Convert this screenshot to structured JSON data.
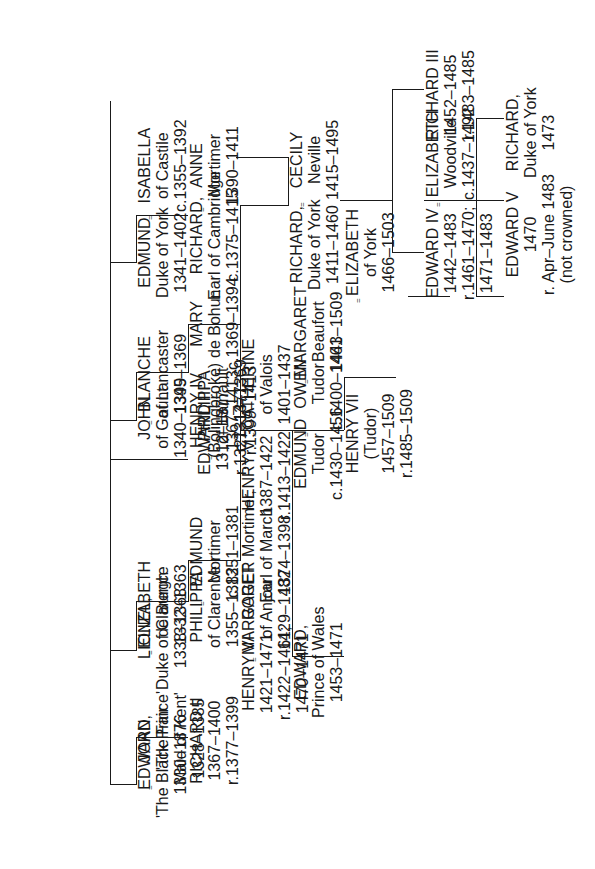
{
  "document": {
    "title": "Plantagenet, Lancaster, York and Tudor Royal Family Tree",
    "orientation": "rotated-90-ccw",
    "ink_color": "#1a1a1a",
    "background_color": "#ffffff"
  },
  "symbols": {
    "marriage": "=",
    "marriage_label": "equals-marriage-symbol"
  },
  "people": {
    "edward_iii": {
      "name": "EDWARD III",
      "life": "1312–1377",
      "reign": "r.1327–1377"
    },
    "philippa_hainault": {
      "name": "PHILIPPA",
      "detail": "of Hainault",
      "life": "c.1314–1369"
    },
    "edward_black_prince": {
      "name": "EDWARD",
      "detail": "'The Black Prince'",
      "life": "1330–1376"
    },
    "joan_kent": {
      "name": "JOAN,",
      "detail": "'The Fair",
      "detail2": "Maid of Kent'",
      "life": "1328–1385"
    },
    "richard_ii": {
      "name": "RICHARD II",
      "life": "1367–1400",
      "reign": "r.1377–1399"
    },
    "lionel_clarence": {
      "name": "LIONEL,",
      "detail": "Duke of Clarence",
      "life": "1338–1368"
    },
    "elizabeth_de_burgh": {
      "name": "ELIZABETH",
      "detail": "de Burgh",
      "life": "1332–1363"
    },
    "philippa_clarence": {
      "name": "PHILIPPA",
      "detail": "of Clarence",
      "life": "1355–1382"
    },
    "edmund_mortimer": {
      "name": "EDMUND",
      "detail": "Mortimer",
      "life": "c.1351–1381"
    },
    "roger_mortimer": {
      "name": "ROGER Mortimer,",
      "detail": "Earl of March",
      "life": "1374–1398"
    },
    "john_gaunt": {
      "name": "JOHN",
      "detail": "of Gaunt",
      "life": "1340–1399"
    },
    "blanche_lancaster": {
      "name": "BLANCHE",
      "detail": "of Lancaster",
      "life": "1345–1369"
    },
    "henry_iv": {
      "name": "HENRY IV",
      "detail": "(Bolingbroke)",
      "life": "1367–1413",
      "reign": "r.1399–1413"
    },
    "mary_de_bohun": {
      "name": "MARY",
      "detail": "de Bohun",
      "life": "c.1369–1394"
    },
    "henry_v": {
      "name": "HENRY V",
      "life": "1387–1422",
      "reign": "r.1413–1422"
    },
    "catherine_valois": {
      "name": "CATHERINE",
      "detail": "of Valois",
      "life": "1401–1437"
    },
    "owen_tudor": {
      "name": "OWEN",
      "detail": "Tudor",
      "life": "c.1400–1461"
    },
    "henry_vi": {
      "name": "HENRY VI",
      "life": "1421–1471",
      "reign": "r.1422–1461;",
      "reign2": "1470–1471"
    },
    "margaret_anjou": {
      "name": "MARGARET",
      "detail": "of Anjou",
      "life": "1429–1482"
    },
    "edward_prince_wales": {
      "name": "EDWARD,",
      "detail": "Prince of Wales",
      "life": "1453–1471"
    },
    "edmund_tudor": {
      "name": "EDMUND",
      "detail": "Tudor",
      "life": "c.1430–1456"
    },
    "margaret_beaufort": {
      "name": "MARGARET",
      "detail": "Beaufort",
      "life": "1443–1509"
    },
    "henry_vii": {
      "name": "HENRY VII",
      "detail": "(Tudor)",
      "life": "1457–1509",
      "reign": "r.1485–1509"
    },
    "elizabeth_of_york": {
      "name": "ELIZABETH",
      "detail": "of York",
      "life": "1466–1503"
    },
    "edmund_york": {
      "name": "EDMUND",
      "detail": "Duke of York",
      "life": "1341–1402"
    },
    "isabella_castile": {
      "name": "ISABELLA",
      "detail": "of Castile",
      "life": "c.1355–1392"
    },
    "richard_cambridge": {
      "name": "RICHARD,",
      "detail": "Earl of Cambridge",
      "life": "c.1375–1415"
    },
    "anne_mortimer": {
      "name": "ANNE",
      "detail": "Mortimer",
      "life": "1390–1411"
    },
    "richard_york": {
      "name": "RICHARD,",
      "detail": "Duke of York",
      "life": "1411–1460"
    },
    "cecily_neville": {
      "name": "CECILY",
      "detail": "Neville",
      "life": "1415–1495"
    },
    "edward_iv": {
      "name": "EDWARD IV",
      "life": "1442–1483",
      "reign": "r.1461–1470;",
      "reign2": "1471–1483"
    },
    "elizabeth_woodville": {
      "name": "ELIZABETH",
      "detail": "Woodville",
      "life": "c.1437–1492"
    },
    "richard_iii": {
      "name": "RICHARD III",
      "life": "1452–1485",
      "reign": "r.1483–1485"
    },
    "edward_v": {
      "name": "EDWARD V",
      "life": "1470",
      "reign": "r. Apr–June 1483",
      "note": "(not crowned)"
    },
    "richard_duke_york_1473": {
      "name": "RICHARD,",
      "detail": "Duke of York",
      "life": "1473"
    }
  }
}
